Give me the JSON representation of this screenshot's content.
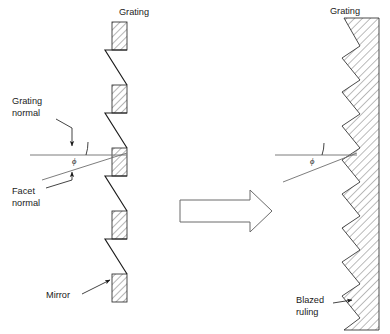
{
  "figure": {
    "title": "",
    "background_color": "#ffffff",
    "ink_color": "#1a1a1a"
  },
  "labels": {
    "grating_left": "Grating",
    "grating_right": "Grating",
    "grating_normal_line1": "Grating",
    "grating_normal_line2": "normal",
    "facet_normal_line1": "Facet",
    "facet_normal_line2": "normal",
    "mirror": "Mirror",
    "blazed_ruling_line1": "Blazed",
    "blazed_ruling_line2": "ruling",
    "angle_symbol_left": "ϕ",
    "angle_symbol_right": "ϕ"
  },
  "left_panel": {
    "description": "Stepped array of discrete mirror facets forming a grating",
    "mirror_count": 5,
    "mirrors": [
      {
        "x": 112,
        "y": 22,
        "width": 15,
        "height": 28
      },
      {
        "x": 112,
        "y": 85,
        "width": 15,
        "height": 28
      },
      {
        "x": 112,
        "y": 148,
        "width": 15,
        "height": 28
      },
      {
        "x": 112,
        "y": 211,
        "width": 15,
        "height": 28
      },
      {
        "x": 112,
        "y": 274,
        "width": 15,
        "height": 28
      }
    ],
    "facet_lines": [
      {
        "x1": 105,
        "y1": 50,
        "x2": 127,
        "y2": 85
      },
      {
        "x1": 105,
        "y1": 113,
        "x2": 127,
        "y2": 148
      },
      {
        "x1": 105,
        "y1": 176,
        "x2": 127,
        "y2": 211
      },
      {
        "x1": 105,
        "y1": 239,
        "x2": 127,
        "y2": 274
      }
    ],
    "grating_normal_ray": {
      "x1": 30,
      "y1": 155,
      "x2": 127,
      "y2": 155
    },
    "facet_normal_ray": {
      "x1": 42,
      "y1": 178,
      "x2": 127,
      "y2": 152
    },
    "angle_value_degrees": 16
  },
  "right_panel": {
    "description": "Continuous blazed (sawtooth) ruled grating block",
    "tooth_count": 9,
    "tooth_pitch": 34,
    "tip_x": 342,
    "valley_x": 360,
    "block_right_x": 379,
    "grating_normal_ray": {
      "x1": 275,
      "y1": 155,
      "x2": 357,
      "y2": 155
    },
    "facet_normal_ray": {
      "x1": 283,
      "y1": 180,
      "x2": 357,
      "y2": 152
    },
    "angle_value_degrees": 16
  },
  "transform_arrow": {
    "name": "rightward-block-arrow",
    "x": 180,
    "y": 190,
    "width": 92,
    "height": 42,
    "direction": "right",
    "fill": "#ffffff",
    "stroke": "#6a6a6a"
  },
  "leader_lines": {
    "grating_normal": {
      "from_x": 42,
      "from_y": 117,
      "to_x": 72,
      "to_y": 150
    },
    "facet_normal": {
      "from_x": 46,
      "from_y": 186,
      "to_x": 72,
      "to_y": 164
    },
    "mirror": {
      "from_x": 80,
      "from_y": 294,
      "to_x": 112,
      "to_y": 281
    },
    "blazed_ruling": {
      "from_x": 332,
      "from_y": 305,
      "to_x": 352,
      "to_y": 297
    }
  }
}
